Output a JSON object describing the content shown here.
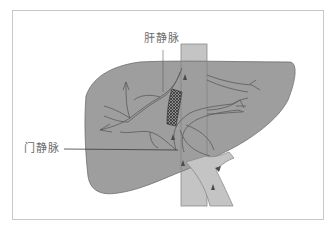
{
  "diagram": {
    "labels": {
      "hepatic_vein": "肝静脉",
      "portal_vein": "门静脉"
    },
    "colors": {
      "liver": "#9e9e9e",
      "liver_outline": "#6e6e6e",
      "vessel": "#c4c4c4",
      "vessel_outline": "#8a8a8a",
      "branch_line": "#5a5a5a",
      "frame_border": "#c8c8c8",
      "label_text": "#6a6a6a"
    }
  }
}
